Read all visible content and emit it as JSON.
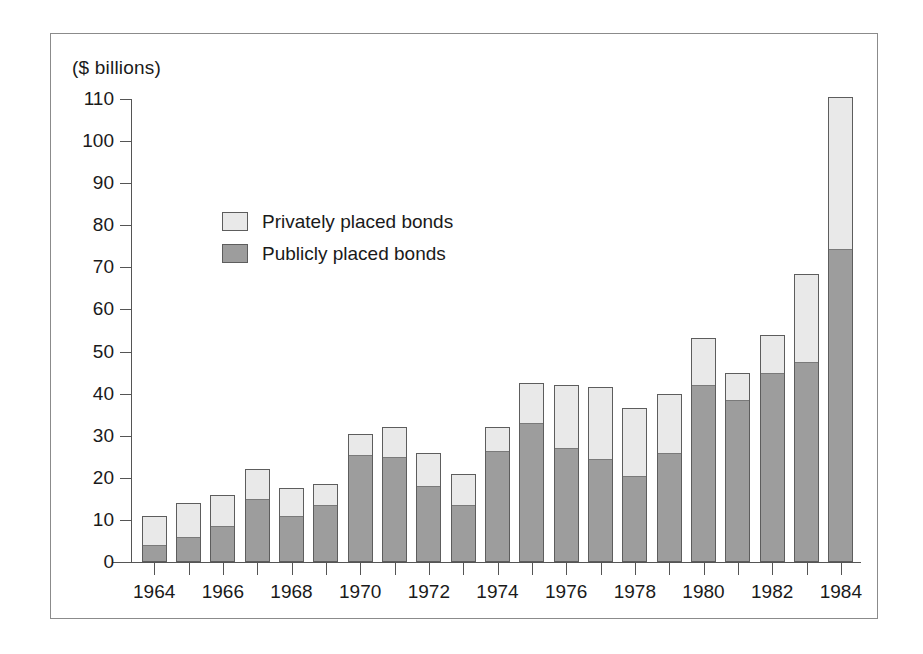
{
  "axis_unit_label": "($ billions)",
  "legend": {
    "position": "inside-upper-left",
    "items": [
      {
        "label": "Privately placed bonds",
        "swatch": "light-gray-swatch-icon",
        "color": "#e9e9e9"
      },
      {
        "label": "Publicly placed bonds",
        "swatch": "dark-gray-swatch-icon",
        "color": "#9d9d9d"
      }
    ]
  },
  "chart_data": {
    "type": "bar",
    "stacked": true,
    "title": "",
    "subtitle": "",
    "xlabel": "",
    "ylabel": "($ billions)",
    "ylim": [
      0,
      110
    ],
    "ytick_step": 10,
    "yticks": [
      110,
      100,
      90,
      80,
      70,
      60,
      50,
      40,
      30,
      20,
      10,
      0
    ],
    "ytick_labels": [
      "110",
      "100",
      "90",
      "80",
      "70",
      "60",
      "50",
      "40",
      "30",
      "20",
      "10",
      "0"
    ],
    "grid": false,
    "categories": [
      "1964",
      "1965",
      "1966",
      "1967",
      "1968",
      "1969",
      "1970",
      "1971",
      "1972",
      "1973",
      "1974",
      "1975",
      "1976",
      "1977",
      "1978",
      "1979",
      "1980",
      "1981",
      "1982",
      "1983",
      "1984"
    ],
    "xtick_labels_shown": [
      "1964",
      "1966",
      "1968",
      "1970",
      "1972",
      "1974",
      "1976",
      "1978",
      "1980",
      "1982",
      "1984"
    ],
    "series": [
      {
        "name": "Publicly placed bonds",
        "color": "#9d9d9d",
        "values": [
          3.5,
          5.5,
          8.0,
          14.5,
          10.5,
          13.0,
          25.0,
          24.5,
          17.5,
          13.0,
          26.0,
          32.5,
          26.5,
          24.0,
          20.0,
          25.5,
          41.5,
          38.0,
          44.5,
          47.0,
          74.0
        ]
      },
      {
        "name": "Privately placed bonds",
        "color": "#e9e9e9",
        "values": [
          7.5,
          8.5,
          7.8,
          7.5,
          7.0,
          5.5,
          5.5,
          7.5,
          8.5,
          8.0,
          6.0,
          10.0,
          15.5,
          17.5,
          16.5,
          14.5,
          11.8,
          6.8,
          9.5,
          21.5,
          36.5
        ]
      }
    ],
    "totals": [
      11.0,
      14.0,
      15.8,
      22.0,
      17.5,
      18.5,
      30.5,
      32.0,
      26.0,
      21.0,
      32.0,
      42.5,
      42.0,
      41.5,
      36.5,
      40.0,
      53.3,
      44.8,
      54.0,
      68.5,
      110.5
    ]
  }
}
